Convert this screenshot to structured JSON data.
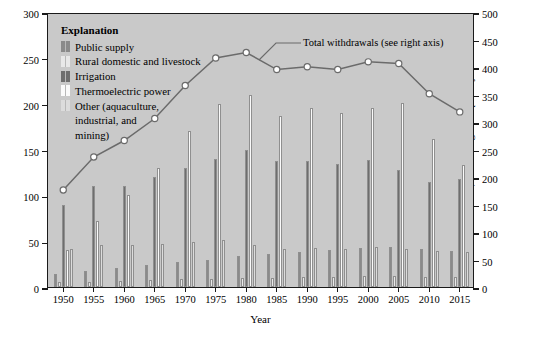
{
  "axes": {
    "y_left_title": "Withdrawals, in billion gallons per day",
    "y_right_title": "Total withdrawals, in billion gallons per day",
    "x_title": "Year",
    "y_left_ticks": [
      "0",
      "50",
      "100",
      "150",
      "200",
      "250",
      "300"
    ],
    "y_right_ticks": [
      "0",
      "50",
      "100",
      "150",
      "200",
      "250",
      "300",
      "350",
      "400",
      "450",
      "500"
    ],
    "x_ticks": [
      "1950",
      "1955",
      "1960",
      "1965",
      "1970",
      "1975",
      "1980",
      "1985",
      "1990",
      "1995",
      "2000",
      "2005",
      "2010",
      "2015"
    ]
  },
  "legend": {
    "title": "Explanation",
    "items": [
      {
        "label": "Public supply",
        "color": "#8a8a8a"
      },
      {
        "label": "Rural domestic and livestock",
        "color": "#e8e8e8"
      },
      {
        "label": "Irrigation",
        "color": "#6e6e6e"
      },
      {
        "label": "Thermoelectric power",
        "color": "#fafafa"
      },
      {
        "label": "Other (aquaculture,",
        "cont": [
          "industrial, and",
          "mining)"
        ],
        "color": "#dcdcdc"
      }
    ]
  },
  "annotation": {
    "text": "Total withdrawals (see right axis)"
  },
  "colors": {
    "plot_background": "#c9c9c9",
    "frame": "#1a1a1a",
    "line": "#6b6b6b",
    "marker_fill": "#ffffff",
    "page_background": "#ffffff"
  },
  "chart_data": {
    "type": "bar",
    "title": "",
    "xlabel": "Year",
    "ylabel": "Withdrawals, in billion gallons per day",
    "ylabel_right": "Total withdrawals, in billion gallons per day",
    "ylim": [
      0,
      300
    ],
    "ylim_right": [
      0,
      500
    ],
    "grid": false,
    "legend_position": "top-left",
    "categories": [
      "1950",
      "1955",
      "1960",
      "1965",
      "1970",
      "1975",
      "1980",
      "1985",
      "1990",
      "1995",
      "2000",
      "2005",
      "2010",
      "2015"
    ],
    "series": [
      {
        "name": "Public supply",
        "color": "#8a8a8a",
        "values": [
          14,
          17,
          21,
          24,
          27,
          29,
          34,
          36,
          38,
          40,
          43,
          44,
          42,
          39
        ]
      },
      {
        "name": "Rural domestic and livestock",
        "color": "#e8e8e8",
        "values": [
          6,
          6,
          7,
          8,
          9,
          9,
          10,
          10,
          11,
          11,
          12,
          12,
          11,
          11
        ]
      },
      {
        "name": "Irrigation",
        "color": "#6e6e6e",
        "values": [
          89,
          110,
          110,
          120,
          130,
          140,
          150,
          137,
          137,
          134,
          139,
          128,
          115,
          118
        ]
      },
      {
        "name": "Thermoelectric power",
        "color": "#fafafa",
        "values": [
          40,
          72,
          100,
          130,
          170,
          200,
          210,
          187,
          195,
          190,
          195,
          201,
          161,
          133
        ]
      },
      {
        "name": "Other (aquaculture, industrial, and mining)",
        "color": "#dcdcdc",
        "values": [
          42,
          46,
          46,
          47,
          49,
          51,
          46,
          42,
          43,
          41,
          44,
          42,
          39,
          38
        ]
      }
    ],
    "line_series": {
      "name": "Total withdrawals (see right axis)",
      "color": "#6b6b6b",
      "axis": "right",
      "values": [
        180,
        240,
        270,
        310,
        370,
        420,
        430,
        399,
        404,
        399,
        413,
        410,
        355,
        322
      ]
    }
  }
}
